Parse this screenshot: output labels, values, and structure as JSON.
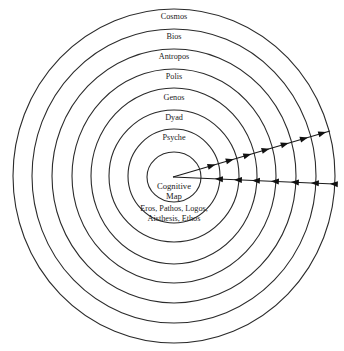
{
  "diagram": {
    "type": "concentric-rings",
    "center": {
      "x": 174,
      "y": 176
    },
    "rings": [
      {
        "label": "Cosmos",
        "rx": 161,
        "ry": 167,
        "label_y": 17
      },
      {
        "label": "Bios",
        "rx": 142,
        "ry": 147,
        "label_y": 37
      },
      {
        "label": "Antropos",
        "rx": 122,
        "ry": 127,
        "label_y": 57
      },
      {
        "label": "Polis",
        "rx": 102,
        "ry": 107,
        "label_y": 77
      },
      {
        "label": "Genos",
        "rx": 83,
        "ry": 88,
        "label_y": 97
      },
      {
        "label": "Dyad",
        "rx": 65,
        "ry": 66,
        "label_y": 117
      },
      {
        "label": "Psyche",
        "rx": 46,
        "ry": 47,
        "label_y": 137
      },
      {
        "label": "",
        "rx": 27,
        "ry": 25,
        "label_y": 0
      }
    ],
    "core": {
      "line1": "Cognitive",
      "line2": "Map"
    },
    "faculties": {
      "line1": "Eros, Pathos, Logos,",
      "line2": "Aisthesis, Ethos"
    },
    "flows": [
      {
        "name": "outward",
        "from": [
          173,
          177
        ],
        "to": [
          330,
          131
        ],
        "direction": "outward",
        "arrow_count": 7
      },
      {
        "name": "inward",
        "from": [
          173,
          177
        ],
        "to": [
          334,
          184
        ],
        "direction": "inward",
        "arrow_count": 7
      }
    ],
    "colors": {
      "stroke": "#2b2b2b",
      "text": "#1a1a1a",
      "background": "#ffffff"
    }
  }
}
